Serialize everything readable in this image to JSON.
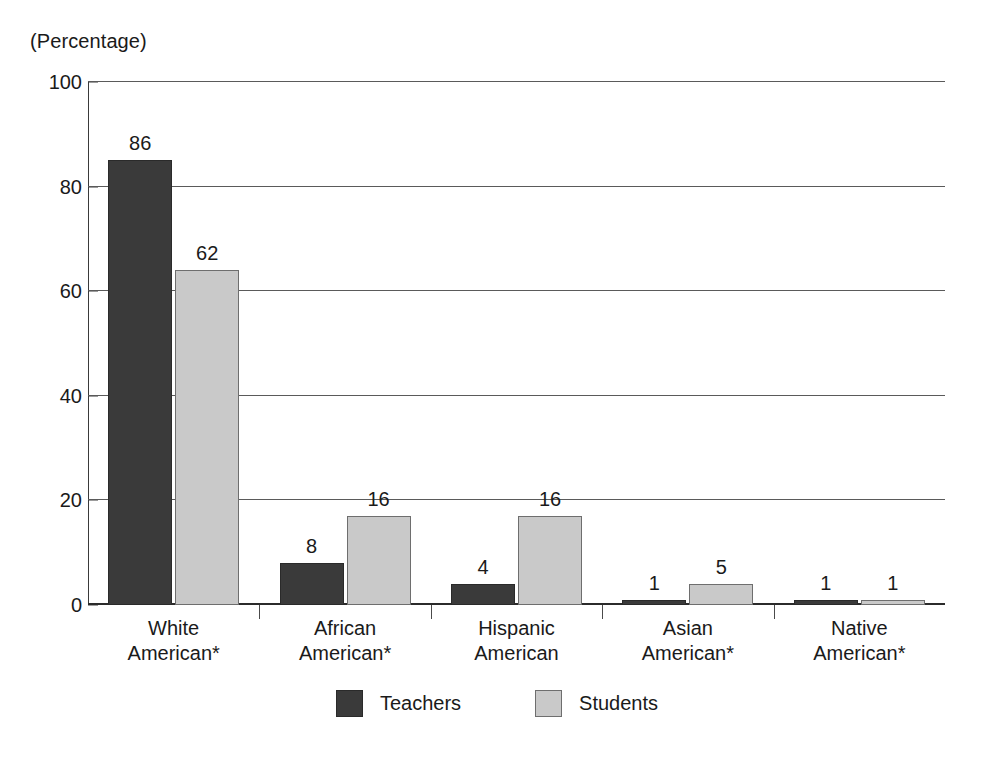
{
  "chart_data": {
    "type": "bar",
    "title": "",
    "subtitle": "",
    "unit_caption": "(Percentage)",
    "xlabel": "",
    "ylabel": "",
    "ylim": [
      0,
      100
    ],
    "yticks": [
      0,
      20,
      40,
      60,
      80,
      100
    ],
    "ytick_labels": [
      "0",
      "20",
      "40",
      "60",
      "80",
      "100"
    ],
    "grid": true,
    "grid_orientation": "horizontal",
    "legend_position": "bottom-center",
    "categories": [
      "White\nAmerican*",
      "African\nAmerican*",
      "Hispanic\nAmerican",
      "Asian\nAmerican*",
      "Native\nAmerican*"
    ],
    "category_lines": [
      [
        "White",
        "American*"
      ],
      [
        "African",
        "American*"
      ],
      [
        "Hispanic",
        "American"
      ],
      [
        "Asian",
        "American*"
      ],
      [
        "Native",
        "American*"
      ]
    ],
    "series": [
      {
        "name": "Teachers",
        "color": "#3a3a3a",
        "values": [
          86,
          8,
          4,
          1,
          1
        ],
        "plotted_heights": [
          85,
          8,
          4,
          1,
          1
        ],
        "labels": [
          "86",
          "8",
          "4",
          "1",
          "1"
        ]
      },
      {
        "name": "Students",
        "color": "#c9c9c9",
        "values": [
          62,
          16,
          16,
          5,
          1
        ],
        "plotted_heights": [
          64,
          17,
          17,
          4,
          1
        ],
        "labels": [
          "62",
          "16",
          "16",
          "5",
          "1"
        ]
      }
    ],
    "footnote": ""
  },
  "legend": {
    "items": [
      {
        "label": "Teachers",
        "swatch": "dark-swatch"
      },
      {
        "label": "Students",
        "swatch": "light-swatch"
      }
    ]
  },
  "colors": {
    "teachers": "#3a3a3a",
    "students": "#c9c9c9",
    "axis": "#2b2b2b",
    "grid": "#5a5a5a",
    "text": "#1a1a1a",
    "background": "#ffffff"
  }
}
